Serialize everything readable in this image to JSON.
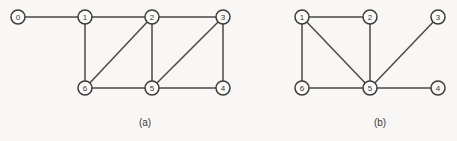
{
  "figure": {
    "background_color": "#f8f7f5",
    "line_color": "#4b4a48",
    "node_fill_color": "#fbfaf8",
    "node_stroke_color": "#3c3b39",
    "node_radius": 7,
    "panels": [
      {
        "id": "panel-a",
        "caption": "(a)",
        "caption_x": 145,
        "caption_y": 122,
        "nodes": [
          {
            "label": "0",
            "x": 18,
            "y": 17
          },
          {
            "label": "1",
            "x": 85,
            "y": 17
          },
          {
            "label": "2",
            "x": 152,
            "y": 17
          },
          {
            "label": "3",
            "x": 223,
            "y": 17
          },
          {
            "label": "6",
            "x": 85,
            "y": 88
          },
          {
            "label": "5",
            "x": 152,
            "y": 88
          },
          {
            "label": "4",
            "x": 223,
            "y": 88
          }
        ],
        "edges": [
          {
            "from": "0",
            "to": "1"
          },
          {
            "from": "1",
            "to": "2"
          },
          {
            "from": "2",
            "to": "3"
          },
          {
            "from": "1",
            "to": "6"
          },
          {
            "from": "2",
            "to": "6"
          },
          {
            "from": "2",
            "to": "5"
          },
          {
            "from": "3",
            "to": "5"
          },
          {
            "from": "3",
            "to": "4"
          },
          {
            "from": "6",
            "to": "5"
          },
          {
            "from": "5",
            "to": "4"
          }
        ]
      },
      {
        "id": "panel-b",
        "caption": "(b)",
        "caption_x": 380,
        "caption_y": 122,
        "nodes": [
          {
            "label": "1",
            "x": 302,
            "y": 17
          },
          {
            "label": "2",
            "x": 370,
            "y": 17
          },
          {
            "label": "3",
            "x": 438,
            "y": 17
          },
          {
            "label": "6",
            "x": 302,
            "y": 88
          },
          {
            "label": "5",
            "x": 370,
            "y": 88
          },
          {
            "label": "4",
            "x": 438,
            "y": 88
          }
        ],
        "edges": [
          {
            "from": "1",
            "to": "2"
          },
          {
            "from": "1",
            "to": "6"
          },
          {
            "from": "1",
            "to": "5"
          },
          {
            "from": "2",
            "to": "5"
          },
          {
            "from": "3",
            "to": "5"
          },
          {
            "from": "4",
            "to": "5"
          },
          {
            "from": "6",
            "to": "5"
          }
        ]
      }
    ]
  }
}
